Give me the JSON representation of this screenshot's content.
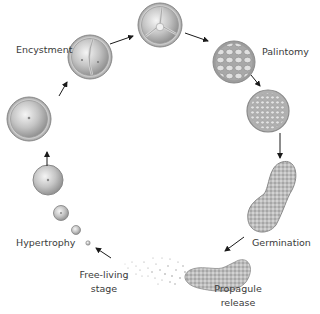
{
  "diagram": {
    "type": "life-cycle",
    "colors": {
      "text": "#3a3a3a",
      "arrow": "#1a1a1a",
      "cell_wall": "#8a8a8a",
      "cell_fill_light": "#f2f2f2",
      "cell_fill_dark": "#9a9a9a"
    },
    "labels": {
      "encystment": "Encystment",
      "palintomy": "Palintomy",
      "germination": "Germination",
      "propagule_release_line1": "Propagule",
      "propagule_release_line2": "release",
      "free_living_line1": "Free-living",
      "free_living_line2": "stage",
      "hypertrophy": "Hypertrophy"
    },
    "stages": [
      {
        "id": "free-living-cell",
        "description": "tiny free-living cell"
      },
      {
        "id": "hypertrophy-1",
        "description": "small growing cell"
      },
      {
        "id": "hypertrophy-2",
        "description": "growing cell"
      },
      {
        "id": "hypertrophy-3",
        "description": "enlarged cell"
      },
      {
        "id": "hypertrophy-4",
        "description": "large cell with thick wall"
      },
      {
        "id": "encystment",
        "description": "cyst divided in two"
      },
      {
        "id": "division",
        "description": "cyst divided in three"
      },
      {
        "id": "palintomy",
        "description": "cyst with many daughter cells"
      },
      {
        "id": "palintomy-dense",
        "description": "cyst packed with small cells"
      },
      {
        "id": "germination",
        "description": "elongated germinating cyst"
      },
      {
        "id": "propagule-release",
        "description": "cyst releasing propagules"
      }
    ]
  }
}
